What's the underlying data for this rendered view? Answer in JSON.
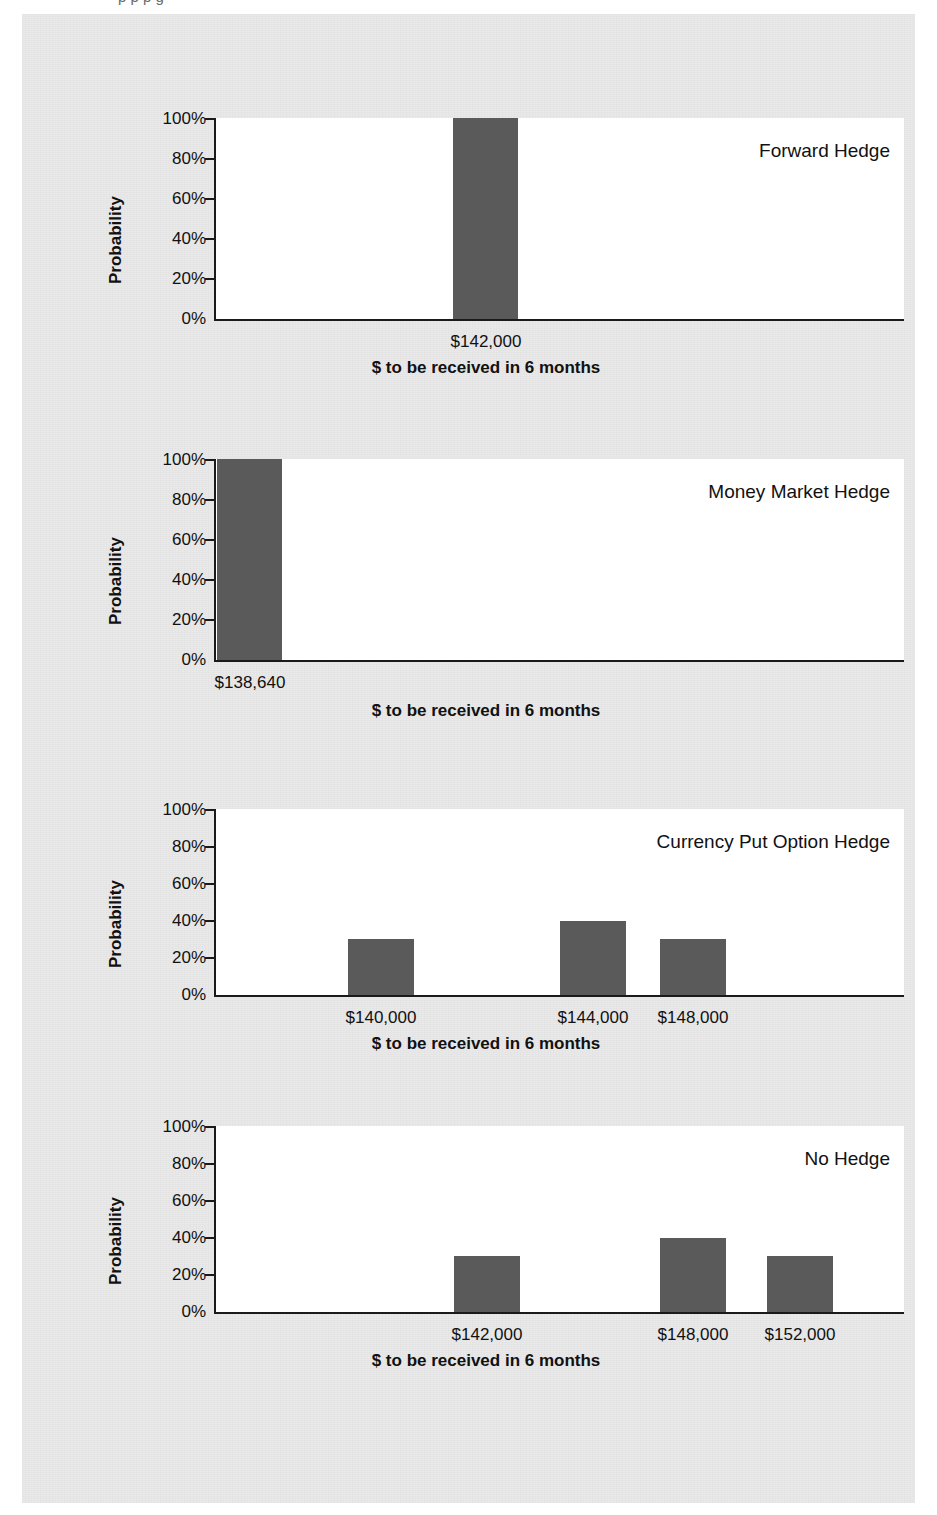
{
  "page": {
    "background_color": "#e9e9e9",
    "bar_color": "#5a5a5a",
    "plot_background": "#ffffff",
    "axis_color": "#1a1a1a",
    "cut_top_text": "p   p      p      g"
  },
  "common": {
    "ylabel": "Probability",
    "yticks": [
      "100%",
      "80%",
      "60%",
      "40%",
      "20%",
      "0%"
    ],
    "xtitle": "$ to be received in 6 months"
  },
  "chart_data": [
    {
      "type": "bar",
      "title": "Forward Hedge",
      "xlabel": "$ to be received in 6 months",
      "ylabel": "Probability",
      "ylim": [
        0,
        100
      ],
      "yticks": [
        0,
        20,
        40,
        60,
        80,
        100
      ],
      "ytick_labels": [
        "0%",
        "20%",
        "40%",
        "60%",
        "80%",
        "100%"
      ],
      "grid": false,
      "legend": "none",
      "categories": [
        "$142,000"
      ],
      "values": [
        100
      ]
    },
    {
      "type": "bar",
      "title": "Money Market Hedge",
      "xlabel": "$ to be received in 6 months",
      "ylabel": "Probability",
      "ylim": [
        0,
        100
      ],
      "yticks": [
        0,
        20,
        40,
        60,
        80,
        100
      ],
      "ytick_labels": [
        "0%",
        "20%",
        "40%",
        "60%",
        "80%",
        "100%"
      ],
      "grid": false,
      "legend": "none",
      "categories": [
        "$138,640"
      ],
      "values": [
        100
      ]
    },
    {
      "type": "bar",
      "title": "Currency Put Option Hedge",
      "xlabel": "$ to be received in 6 months",
      "ylabel": "Probability",
      "ylim": [
        0,
        100
      ],
      "yticks": [
        0,
        20,
        40,
        60,
        80,
        100
      ],
      "ytick_labels": [
        "0%",
        "20%",
        "40%",
        "60%",
        "80%",
        "100%"
      ],
      "grid": false,
      "legend": "none",
      "categories": [
        "$140,000",
        "$144,000",
        "$148,000"
      ],
      "values": [
        30,
        40,
        30
      ]
    },
    {
      "type": "bar",
      "title": "No Hedge",
      "xlabel": "$ to be received in 6 months",
      "ylabel": "Probability",
      "ylim": [
        0,
        100
      ],
      "yticks": [
        0,
        20,
        40,
        60,
        80,
        100
      ],
      "ytick_labels": [
        "0%",
        "20%",
        "40%",
        "60%",
        "80%",
        "100%"
      ],
      "grid": false,
      "legend": "none",
      "categories": [
        "$142,000",
        "$148,000",
        "$152,000"
      ],
      "values": [
        30,
        40,
        30
      ]
    }
  ],
  "charts": [
    {
      "hedge_label": "Forward Hedge",
      "ylabel": "Probability",
      "xtitle": "$ to be received in 6 months",
      "yticks": [
        "100%",
        "80%",
        "60%",
        "40%",
        "20%",
        "0%"
      ],
      "bars": [
        {
          "label": "$142,000",
          "value": 100
        }
      ]
    },
    {
      "hedge_label": "Money Market Hedge",
      "ylabel": "Probability",
      "xtitle": "$ to be received in 6 months",
      "yticks": [
        "100%",
        "80%",
        "60%",
        "40%",
        "20%",
        "0%"
      ],
      "bars": [
        {
          "label": "$138,640",
          "value": 100
        }
      ]
    },
    {
      "hedge_label": "Currency Put Option Hedge",
      "ylabel": "Probability",
      "xtitle": "$ to be received in 6 months",
      "yticks": [
        "100%",
        "80%",
        "60%",
        "40%",
        "20%",
        "0%"
      ],
      "bars": [
        {
          "label": "$140,000",
          "value": 30
        },
        {
          "label": "$144,000",
          "value": 40
        },
        {
          "label": "$148,000",
          "value": 30
        }
      ]
    },
    {
      "hedge_label": "No Hedge",
      "ylabel": "Probability",
      "xtitle": "$ to be received in 6 months",
      "yticks": [
        "100%",
        "80%",
        "60%",
        "40%",
        "20%",
        "0%"
      ],
      "bars": [
        {
          "label": "$142,000",
          "value": 30
        },
        {
          "label": "$148,000",
          "value": 40
        },
        {
          "label": "$152,000",
          "value": 30
        }
      ]
    }
  ]
}
